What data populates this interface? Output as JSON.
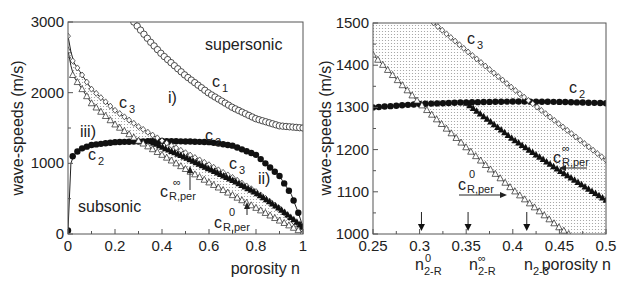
{
  "chart_data": [
    {
      "type": "scatter",
      "title": "",
      "xlabel": "porosity n",
      "ylabel": "wave-speeds (m/s)",
      "xlim": [
        0,
        1
      ],
      "ylim": [
        0,
        3000
      ],
      "xticks": [
        "0",
        "0.2",
        "0.4",
        "0.6",
        "0.8",
        "1"
      ],
      "yticks": [
        "0",
        "1000",
        "2000",
        "3000"
      ],
      "grid": false,
      "annotations": [
        "supersonic",
        "subsonic",
        "i)",
        "ii)",
        "iii)",
        "c1",
        "c2",
        "c2",
        "c3",
        "c3",
        "cR,per ∞",
        "cR,per 0"
      ],
      "series": [
        {
          "name": "c1",
          "marker": "open-circle",
          "x": [
            0.28,
            0.35,
            0.4,
            0.5,
            0.6,
            0.7,
            0.8,
            0.9,
            1.0
          ],
          "y": [
            3000,
            2720,
            2540,
            2240,
            1990,
            1790,
            1630,
            1530,
            1500
          ]
        },
        {
          "name": "c2",
          "marker": "filled-circle",
          "x": [
            0,
            0.005,
            0.02,
            0.05,
            0.1,
            0.2,
            0.3,
            0.4,
            0.5,
            0.6,
            0.7,
            0.8,
            0.9,
            0.95,
            0.98,
            1.0
          ],
          "y": [
            50,
            900,
            1100,
            1200,
            1260,
            1300,
            1310,
            1315,
            1310,
            1300,
            1250,
            1120,
            820,
            560,
            300,
            100
          ]
        },
        {
          "name": "c3",
          "marker": "open-diamond",
          "x": [
            0,
            0.02,
            0.1,
            0.2,
            0.3,
            0.4,
            0.5,
            0.6,
            0.7,
            0.8,
            0.9,
            1.0
          ],
          "y": [
            2800,
            2450,
            2050,
            1750,
            1520,
            1320,
            1150,
            980,
            800,
            600,
            360,
            50
          ]
        },
        {
          "name": "cR,per ∞",
          "marker": "filled-triangle",
          "x": [
            0.35,
            0.4,
            0.5,
            0.6,
            0.7,
            0.8,
            0.9,
            1.0
          ],
          "y": [
            1310,
            1230,
            1080,
            920,
            760,
            580,
            360,
            100
          ]
        },
        {
          "name": "cR,per 0",
          "marker": "open-triangle",
          "x": [
            0,
            0.02,
            0.1,
            0.2,
            0.3,
            0.4,
            0.5,
            0.6,
            0.7,
            0.8,
            0.9,
            1.0
          ],
          "y": [
            2600,
            2250,
            1850,
            1550,
            1320,
            1120,
            920,
            730,
            550,
            370,
            190,
            20
          ]
        }
      ]
    },
    {
      "type": "scatter",
      "title": "",
      "xlabel": "porosity n",
      "ylabel": "wave-speeds (m/s)",
      "xlim": [
        0.25,
        0.5
      ],
      "ylim": [
        1000,
        1500
      ],
      "xticks": [
        "0.25",
        "0.3",
        "0.35",
        "0.4",
        "0.45",
        "0.5"
      ],
      "yticks": [
        "1000",
        "1100",
        "1200",
        "1300",
        "1400",
        "1500"
      ],
      "grid": false,
      "annotations": [
        "c3",
        "c2",
        "cR,per ∞",
        "cR,per 0"
      ],
      "markers_on_x_axis": [
        {
          "label": "n2-R 0",
          "x": 0.302
        },
        {
          "label": "n2-R ∞",
          "x": 0.352
        },
        {
          "label": "n2-3",
          "x": 0.415
        }
      ],
      "series": [
        {
          "name": "c2",
          "marker": "filled-circle",
          "x": [
            0.25,
            0.3,
            0.35,
            0.4,
            0.45,
            0.5
          ],
          "y": [
            1300,
            1308,
            1312,
            1314,
            1313,
            1310
          ]
        },
        {
          "name": "c3",
          "marker": "open-diamond",
          "x": [
            0.315,
            0.35,
            0.4,
            0.45,
            0.5
          ],
          "y": [
            1500,
            1435,
            1345,
            1260,
            1175
          ]
        },
        {
          "name": "cR,per ∞",
          "marker": "filled-triangle",
          "x": [
            0.35,
            0.4,
            0.45,
            0.5
          ],
          "y": [
            1310,
            1225,
            1150,
            1080
          ]
        },
        {
          "name": "cR,per 0",
          "marker": "open-triangle",
          "x": [
            0.25,
            0.3,
            0.35,
            0.4,
            0.45,
            0.46
          ],
          "y": [
            1425,
            1310,
            1205,
            1105,
            1015,
            1000
          ]
        }
      ]
    }
  ],
  "left": {
    "ylabel": "wave-speeds (m/s)",
    "xlabel": "porosity n",
    "yticks": [
      "0",
      "1000",
      "2000",
      "3000"
    ],
    "xticks": [
      "0",
      "0.2",
      "0.4",
      "0.6",
      "0.8",
      "1"
    ],
    "labels": {
      "supersonic": "supersonic",
      "subsonic": "subsonic",
      "i": "i)",
      "ii": "ii)",
      "iii": "iii)",
      "c1": "c",
      "c1_sub": "1",
      "c2": "c",
      "c2_sub": "2",
      "c3": "c",
      "c3_sub": "3",
      "cR": "c",
      "cR_sub": "R,per",
      "inf": "∞",
      "zero": "0"
    }
  },
  "right": {
    "ylabel": "wave-speeds (m/s)",
    "xlabel": "porosity n",
    "yticks": [
      "1000",
      "1100",
      "1200",
      "1300",
      "1400",
      "1500"
    ],
    "xticks": [
      "0.25",
      "0.3",
      "0.35",
      "0.4",
      "0.45",
      "0.5"
    ],
    "labels": {
      "n": "n",
      "n_sub_2R": "2-R",
      "n_sub_23": "2-3",
      "zero": "0",
      "inf": "∞"
    }
  }
}
